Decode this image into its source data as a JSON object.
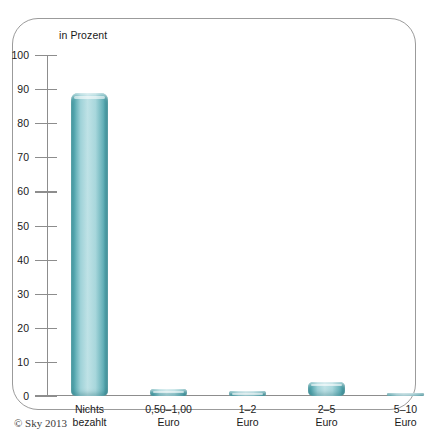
{
  "chart_data": {
    "type": "bar",
    "title": "",
    "ylabel": "in Prozent",
    "xlabel": "",
    "categories": [
      "Nichts bezahlt",
      "0,50–1,00 Euro",
      "1–2 Euro",
      "2–5 Euro",
      "5–10 Euro"
    ],
    "category_lines": [
      [
        "Nichts",
        "bezahlt"
      ],
      [
        "0,50–1,00",
        "Euro"
      ],
      [
        "1–2",
        "Euro"
      ],
      [
        "2–5",
        "Euro"
      ],
      [
        "5–10",
        "Euro"
      ]
    ],
    "values": [
      89,
      2,
      1.5,
      4,
      0.8
    ],
    "ylim": [
      0,
      100
    ],
    "yticks": [
      100,
      90,
      80,
      70,
      60,
      50,
      40,
      30,
      20,
      10,
      0
    ],
    "ytick_labels": [
      "100",
      "90",
      "80",
      "70",
      "60",
      "50",
      "40",
      "30",
      "20",
      "10",
      "0"
    ],
    "grid": false,
    "legend": null,
    "bar_color": "#7cc3cb",
    "bar_edge_color": "#2f8a93",
    "axis_color": "#8d8d8d"
  },
  "footer": {
    "copyright": "© Sky 2013"
  },
  "frame": {
    "border_color": "#9b9b9b"
  }
}
